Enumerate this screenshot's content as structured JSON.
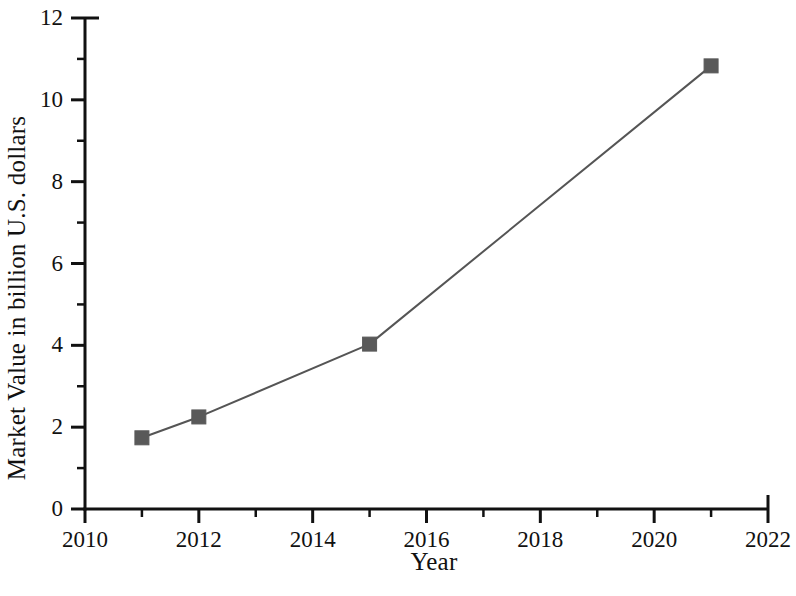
{
  "chart_data": {
    "type": "line",
    "title": "",
    "xlabel": "Year",
    "ylabel": "Market Value in billion U.S. dollars",
    "x": [
      2011,
      2012,
      2015,
      2021
    ],
    "values": [
      1.74,
      2.25,
      4.03,
      10.83
    ],
    "series": [
      {
        "name": "Market Value",
        "x": [
          2011,
          2012,
          2015,
          2021
        ],
        "values": [
          1.74,
          2.25,
          4.03,
          10.83
        ]
      }
    ],
    "xlim": [
      2010,
      2022
    ],
    "ylim": [
      0,
      12
    ],
    "x_major_ticks": [
      2010,
      2012,
      2014,
      2016,
      2018,
      2020,
      2022
    ],
    "x_minor_ticks": [
      2011,
      2013,
      2015,
      2017,
      2019,
      2021
    ],
    "y_major_ticks": [
      0,
      2,
      4,
      6,
      8,
      10,
      12
    ],
    "y_minor_ticks": [
      1,
      3,
      5,
      7,
      9,
      11
    ],
    "x_tick_labels": [
      "2010",
      "2012",
      "2014",
      "2016",
      "2018",
      "2020",
      "2022"
    ],
    "y_tick_labels": [
      "0",
      "2",
      "4",
      "6",
      "8",
      "10",
      "12"
    ],
    "grid": false,
    "legend": false,
    "legend_position": "none",
    "marker": "square",
    "marker_color": "#595959",
    "line_color": "#555555",
    "axis_color": "#111111",
    "background_color": "#ffffff"
  }
}
